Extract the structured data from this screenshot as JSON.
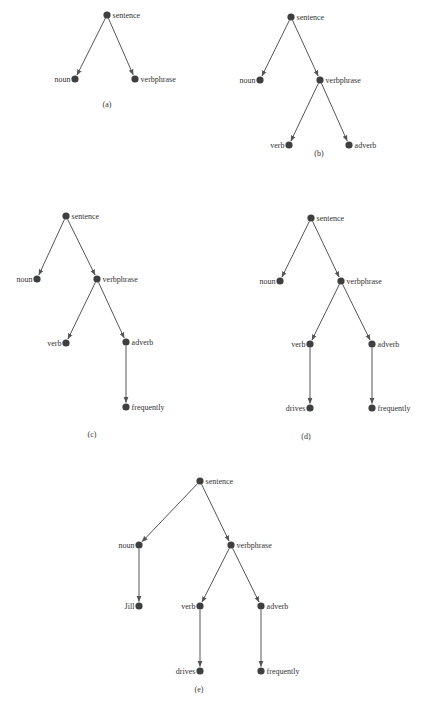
{
  "figure": {
    "colors": {
      "node": "#3f3f3f",
      "edge": "#555555",
      "text": "#333333",
      "background": "#ffffff"
    },
    "trees": [
      {
        "caption": "(a)",
        "caption_pos": [
          107,
          107
        ],
        "nodes": [
          {
            "id": "sentence",
            "label": "sentence",
            "x": 107,
            "y": 15,
            "side": "right"
          },
          {
            "id": "noun",
            "label": "noun",
            "x": 75,
            "y": 79,
            "side": "left"
          },
          {
            "id": "verbphrase",
            "label": "verbphrase",
            "x": 135,
            "y": 79,
            "side": "right"
          }
        ],
        "edges": [
          [
            "sentence",
            "noun"
          ],
          [
            "sentence",
            "verbphrase"
          ]
        ]
      },
      {
        "caption": "(b)",
        "caption_pos": [
          319,
          156
        ],
        "nodes": [
          {
            "id": "sentence",
            "label": "sentence",
            "x": 291,
            "y": 17,
            "side": "right"
          },
          {
            "id": "noun",
            "label": "noun",
            "x": 260,
            "y": 80,
            "side": "left"
          },
          {
            "id": "verbphrase",
            "label": "verbphrase",
            "x": 320,
            "y": 80,
            "side": "right"
          },
          {
            "id": "verb",
            "label": "verb",
            "x": 289,
            "y": 145,
            "side": "left"
          },
          {
            "id": "adverb",
            "label": "adverb",
            "x": 349,
            "y": 145,
            "side": "right"
          }
        ],
        "edges": [
          [
            "sentence",
            "noun"
          ],
          [
            "sentence",
            "verbphrase"
          ],
          [
            "verbphrase",
            "verb"
          ],
          [
            "verbphrase",
            "adverb"
          ]
        ]
      },
      {
        "caption": "(c)",
        "caption_pos": [
          92,
          437
        ],
        "nodes": [
          {
            "id": "sentence",
            "label": "sentence",
            "x": 66,
            "y": 216,
            "side": "right"
          },
          {
            "id": "noun",
            "label": "noun",
            "x": 37,
            "y": 279,
            "side": "left"
          },
          {
            "id": "verbphrase",
            "label": "verbphrase",
            "x": 97,
            "y": 279,
            "side": "right"
          },
          {
            "id": "verb",
            "label": "verb",
            "x": 66,
            "y": 343,
            "side": "left"
          },
          {
            "id": "adverb",
            "label": "adverb",
            "x": 126,
            "y": 342,
            "side": "right"
          },
          {
            "id": "frequently",
            "label": "frequently",
            "x": 126,
            "y": 407,
            "side": "right"
          }
        ],
        "edges": [
          [
            "sentence",
            "noun"
          ],
          [
            "sentence",
            "verbphrase"
          ],
          [
            "verbphrase",
            "verb"
          ],
          [
            "verbphrase",
            "adverb"
          ],
          [
            "adverb",
            "frequently"
          ]
        ]
      },
      {
        "caption": "(d)",
        "caption_pos": [
          306,
          439
        ],
        "nodes": [
          {
            "id": "sentence",
            "label": "sentence",
            "x": 311,
            "y": 218,
            "side": "right"
          },
          {
            "id": "noun",
            "label": "noun",
            "x": 280,
            "y": 281,
            "side": "left"
          },
          {
            "id": "verbphrase",
            "label": "verbphrase",
            "x": 341,
            "y": 281,
            "side": "right"
          },
          {
            "id": "verb",
            "label": "verb",
            "x": 310,
            "y": 344,
            "side": "left"
          },
          {
            "id": "adverb",
            "label": "adverb",
            "x": 372,
            "y": 344,
            "side": "right"
          },
          {
            "id": "drives",
            "label": "drives",
            "x": 310,
            "y": 408,
            "side": "left"
          },
          {
            "id": "frequently",
            "label": "frequently",
            "x": 372,
            "y": 408,
            "side": "right"
          }
        ],
        "edges": [
          [
            "sentence",
            "noun"
          ],
          [
            "sentence",
            "verbphrase"
          ],
          [
            "verbphrase",
            "verb"
          ],
          [
            "verbphrase",
            "adverb"
          ],
          [
            "verb",
            "drives"
          ],
          [
            "adverb",
            "frequently"
          ]
        ]
      },
      {
        "caption": "(e)",
        "caption_pos": [
          199,
          692
        ],
        "nodes": [
          {
            "id": "sentence",
            "label": "sentence",
            "x": 200,
            "y": 481,
            "side": "right"
          },
          {
            "id": "noun",
            "label": "noun",
            "x": 139,
            "y": 545,
            "side": "left"
          },
          {
            "id": "verbphrase",
            "label": "verbphrase",
            "x": 231,
            "y": 545,
            "side": "right"
          },
          {
            "id": "jill",
            "label": "Jill",
            "x": 139,
            "y": 606,
            "side": "left"
          },
          {
            "id": "verb",
            "label": "verb",
            "x": 200,
            "y": 606,
            "side": "left"
          },
          {
            "id": "adverb",
            "label": "adverb",
            "x": 261,
            "y": 606,
            "side": "right"
          },
          {
            "id": "drives",
            "label": "drives",
            "x": 200,
            "y": 671,
            "side": "left"
          },
          {
            "id": "frequently",
            "label": "frequently",
            "x": 261,
            "y": 671,
            "side": "right"
          }
        ],
        "edges": [
          [
            "sentence",
            "noun"
          ],
          [
            "sentence",
            "verbphrase"
          ],
          [
            "noun",
            "jill"
          ],
          [
            "verbphrase",
            "verb"
          ],
          [
            "verbphrase",
            "adverb"
          ],
          [
            "verb",
            "drives"
          ],
          [
            "adverb",
            "frequently"
          ]
        ]
      }
    ]
  }
}
